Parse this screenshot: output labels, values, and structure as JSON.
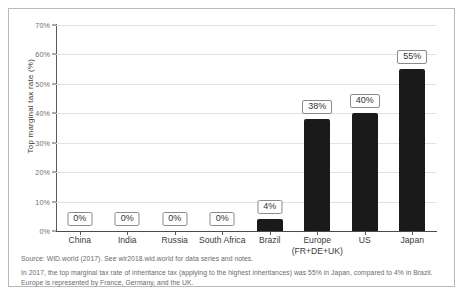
{
  "chart_data": {
    "type": "bar",
    "title": "",
    "xlabel": "",
    "ylabel": "Top marginal tax rate (%)",
    "ylim": [
      0,
      70
    ],
    "grid": true,
    "legend": "none",
    "categories": [
      "China",
      "India",
      "Russia",
      "South Africa",
      "Brazil",
      "Europe (FR+DE+UK)",
      "US",
      "Japan"
    ],
    "values": [
      0,
      0,
      0,
      0,
      4,
      38,
      40,
      55
    ],
    "data_labels": [
      "0%",
      "0%",
      "0%",
      "0%",
      "4%",
      "38%",
      "40%",
      "55%"
    ],
    "ytick_labels": [
      "0%",
      "10%",
      "20%",
      "30%",
      "40%",
      "50%",
      "60%",
      "70%"
    ],
    "ytick_values": [
      0,
      10,
      20,
      30,
      40,
      50,
      60,
      70
    ],
    "bar_color": "#1a1a1a"
  },
  "axes": {
    "y_title": "Top marginal tax rate (%)"
  },
  "categories_display": [
    {
      "line1": "China",
      "line2": ""
    },
    {
      "line1": "India",
      "line2": ""
    },
    {
      "line1": "Russia",
      "line2": ""
    },
    {
      "line1": "South Africa",
      "line2": ""
    },
    {
      "line1": "Brazil",
      "line2": ""
    },
    {
      "line1": "Europe",
      "line2": "(FR+DE+UK)"
    },
    {
      "line1": "US",
      "line2": ""
    },
    {
      "line1": "Japan",
      "line2": ""
    }
  ],
  "notes": {
    "source": "Source: WID.world (2017). See wir2018.wid.world for data series and notes.",
    "body": "In 2017, the top marginal tax rate of inheritance tax (applying to the highest inheritances) was 55% in Japan, compared to 4% in Brazil. Europe is represented by France, Germany, and the UK."
  },
  "colors": {
    "bar": "#1a1a1a",
    "grid": "#e2e2e2",
    "axis": "#4a4a4a",
    "note_text": "#6b6b6b",
    "frame": "#b9b9b9"
  }
}
